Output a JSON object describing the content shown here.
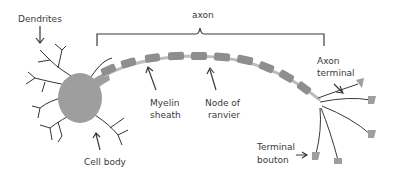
{
  "diagram": {
    "colors": {
      "cell_body": "#9e9e9e",
      "myelin": "#8e8e8e",
      "axon_line": "#bdbdbd",
      "line": "#3a3a3a",
      "text": "#3a3a3a"
    },
    "labels": {
      "dendrites": "Dendrites",
      "axon": "axon",
      "axon_terminal_line1": "Axon",
      "axon_terminal_line2": "terminal",
      "myelin_sheath_line1": "Myelin",
      "myelin_sheath_line2": "sheath",
      "node_of_ranvier_line1": "Node of",
      "node_of_ranvier_line2": "ranvier",
      "cell_body": "Cell body",
      "terminal_bouton_line1": "Terminal",
      "terminal_bouton_line2": "bouton"
    }
  }
}
